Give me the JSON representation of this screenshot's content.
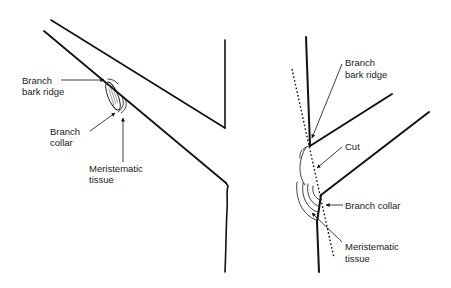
{
  "diagram": {
    "left_panel": {
      "name": "Branch attachment (before pruning)",
      "labels": {
        "bark_ridge": [
          "Branch",
          "bark ridge"
        ],
        "collar": [
          "Branch",
          "collar"
        ],
        "meristematic": [
          "Meristematic",
          "tissue"
        ]
      }
    },
    "right_panel": {
      "name": "Proper pruning cut",
      "labels": {
        "bark_ridge": [
          "Branch",
          "bark ridge"
        ],
        "cut": [
          "Cut"
        ],
        "collar": [
          "Branch collar"
        ],
        "meristematic": [
          "Meristematic",
          "tissue"
        ]
      }
    },
    "colors": {
      "line": "#111111",
      "background": "#ffffff"
    }
  }
}
